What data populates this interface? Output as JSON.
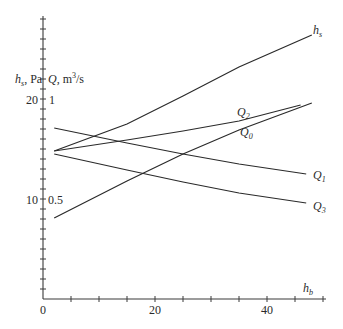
{
  "chart_data": {
    "type": "line",
    "title": "",
    "xlabel": "h_b",
    "ylabel_left": "h_s, Pa",
    "ylabel_right": "Q, m^3/s",
    "xlim": [
      0,
      50
    ],
    "ylim": [
      0,
      28
    ],
    "x_ticks": [
      0,
      20,
      40
    ],
    "y_ticks_left": [
      10,
      20
    ],
    "y_ticks_right": [
      0.5,
      1
    ],
    "grid": false,
    "legend": "inline labels at line ends",
    "series": [
      {
        "name": "h_s",
        "x": [
          2,
          15,
          25,
          35,
          48
        ],
        "y": [
          14.8,
          17.5,
          20.3,
          23.2,
          26.4
        ]
      },
      {
        "name": "Q_2",
        "x": [
          2,
          15,
          25,
          35,
          46
        ],
        "y": [
          14.8,
          15.9,
          16.8,
          17.8,
          19.4
        ]
      },
      {
        "name": "Q_0",
        "x": [
          2,
          15,
          25,
          35,
          48
        ],
        "y": [
          8.1,
          11.8,
          14.5,
          16.9,
          19.6
        ]
      },
      {
        "name": "Q_1",
        "x": [
          2,
          15,
          25,
          35,
          47
        ],
        "y": [
          17.1,
          15.6,
          14.5,
          13.5,
          12.5
        ]
      },
      {
        "name": "Q_3",
        "x": [
          2,
          15,
          25,
          35,
          47
        ],
        "y": [
          14.5,
          12.9,
          11.7,
          10.6,
          9.6
        ]
      }
    ]
  },
  "axis": {
    "y_left_label_main": "h",
    "y_left_label_sub": "s",
    "y_left_label_unit": ", Pa",
    "y_right_label_main": "Q",
    "y_right_label_unit": ", m",
    "y_right_label_sup": "3",
    "y_right_label_tail": "/s",
    "x_label_main": "h",
    "x_label_sub": "b",
    "tick_left_20": "20",
    "tick_left_10": "10",
    "tick_right_1": "1",
    "tick_right_05": "0.5",
    "tick_x_0": "0",
    "tick_x_20": "20",
    "tick_x_40": "40"
  },
  "labels": {
    "hs_main": "h",
    "hs_sub": "s",
    "q2_main": "Q",
    "q2_sub": "2",
    "q0_main": "Q",
    "q0_sub": "0",
    "q1_main": "Q",
    "q1_sub": "1",
    "q3_main": "Q",
    "q3_sub": "3"
  },
  "colors": {
    "line": "#2a2a2a",
    "background": "#ffffff"
  }
}
